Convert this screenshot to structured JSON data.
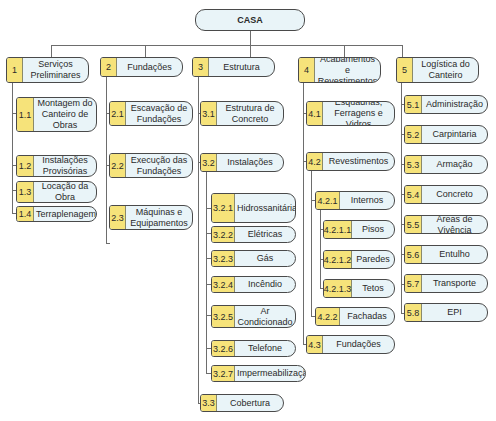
{
  "root": {
    "label": "CASA"
  },
  "branches": [
    {
      "num": "1",
      "label": "Serviços\nPreliminares",
      "children": [
        {
          "num": "1.1",
          "label": "Montagem do\nCanteiro de\nObras"
        },
        {
          "num": "1.2",
          "label": "Instalações\nProvisórias"
        },
        {
          "num": "1.3",
          "label": "Locação da\nObra"
        },
        {
          "num": "1.4",
          "label": "Terraplenagem"
        }
      ]
    },
    {
      "num": "2",
      "label": "Fundações",
      "children": [
        {
          "num": "2.1",
          "label": "Escavação de\nFundações"
        },
        {
          "num": "2.2",
          "label": "Execução das\nFundações"
        },
        {
          "num": "2.3",
          "label": "Máquinas e\nEquipamentos"
        }
      ]
    },
    {
      "num": "3",
      "label": "Estrutura",
      "children": [
        {
          "num": "3.1",
          "label": "Estrutura de\nConcreto"
        },
        {
          "num": "3.2",
          "label": "Instalações",
          "children": [
            {
              "num": "3.2.1",
              "label": "Hidrossanitárias"
            },
            {
              "num": "3.2.2",
              "label": "Elétricas"
            },
            {
              "num": "3.2.3",
              "label": "Gás"
            },
            {
              "num": "3.2.4",
              "label": "Incêndio"
            },
            {
              "num": "3.2.5",
              "label": "Ar\nCondicionado"
            },
            {
              "num": "3.2.6",
              "label": "Telefone"
            },
            {
              "num": "3.2.7",
              "label": "Impermeabilização"
            }
          ]
        },
        {
          "num": "3.3",
          "label": "Cobertura"
        }
      ]
    },
    {
      "num": "4",
      "label": "Acabamentos e\nRevestimentos",
      "children": [
        {
          "num": "4.1",
          "label": "Esquadrias,\nFerragens e Vidros"
        },
        {
          "num": "4.2",
          "label": "Revestimentos",
          "children": [
            {
              "num": "4.2.1",
              "label": "Internos",
              "children": [
                {
                  "num": "4.2.1.1",
                  "label": "Pisos"
                },
                {
                  "num": "4.2.1.2",
                  "label": "Paredes"
                },
                {
                  "num": "4.2.1.3",
                  "label": "Tetos"
                }
              ]
            },
            {
              "num": "4.2.2",
              "label": "Fachadas"
            }
          ]
        },
        {
          "num": "4.3",
          "label": "Fundações"
        }
      ]
    },
    {
      "num": "5",
      "label": "Logística do\nCanteiro",
      "children": [
        {
          "num": "5.1",
          "label": "Administração"
        },
        {
          "num": "5.2",
          "label": "Carpintaria"
        },
        {
          "num": "5.3",
          "label": "Armação"
        },
        {
          "num": "5.4",
          "label": "Concreto"
        },
        {
          "num": "5.5",
          "label": "Áreas de Vivência"
        },
        {
          "num": "5.6",
          "label": "Entulho"
        },
        {
          "num": "5.7",
          "label": "Transporte"
        },
        {
          "num": "5.8",
          "label": "EPI"
        }
      ]
    }
  ],
  "colors": {
    "number_fill": "#f6e37a",
    "box_fill": "#e9f4f8",
    "border": "#4a4a4a",
    "connector": "#6d6d6d"
  }
}
